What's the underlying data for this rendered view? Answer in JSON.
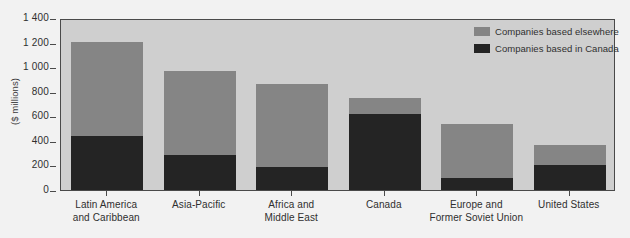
{
  "chart_data": {
    "type": "bar",
    "subtype": "stacked-vertical",
    "title": "",
    "xlabel": "",
    "ylabel": "($ millions)",
    "ylim": [
      0,
      1400
    ],
    "ytick_values": [
      0,
      200,
      400,
      600,
      800,
      1000,
      1200,
      1400
    ],
    "ytick_labels": [
      "0",
      "200",
      "400",
      "600",
      "800",
      "1 000",
      "1 200",
      "1 400"
    ],
    "grid": false,
    "legend_position": "top-right",
    "categories": [
      "Latin America and Caribbean",
      "Asia-Pacific",
      "Africa and Middle East",
      "Canada",
      "Europe and Former Soviet Union",
      "United States"
    ],
    "category_label_lines": [
      [
        "Latin America",
        "and Caribbean"
      ],
      [
        "Asia-Pacific"
      ],
      [
        "Africa and",
        "Middle East"
      ],
      [
        "Canada"
      ],
      [
        "Europe and",
        "Former Soviet Union"
      ],
      [
        "United States"
      ]
    ],
    "series": [
      {
        "name": "Companies based in Canada",
        "color": "#242424",
        "values": [
          440,
          285,
          185,
          620,
          100,
          205
        ]
      },
      {
        "name": "Companies based elsewhere",
        "color": "#858585",
        "values": [
          765,
          680,
          680,
          130,
          435,
          160
        ]
      }
    ],
    "totals": [
      1205,
      965,
      865,
      750,
      535,
      365
    ]
  },
  "legend": {
    "items": [
      {
        "label": "Companies based elsewhere",
        "color": "#858585"
      },
      {
        "label": "Companies based in Canada",
        "color": "#242424"
      }
    ]
  },
  "colors": {
    "page_background": "#f2f2f2",
    "plot_background": "#cfcfcf",
    "axis": "#4a4a4a",
    "text": "#2f2f2f",
    "series_elsewhere": "#858585",
    "series_canada": "#242424"
  }
}
